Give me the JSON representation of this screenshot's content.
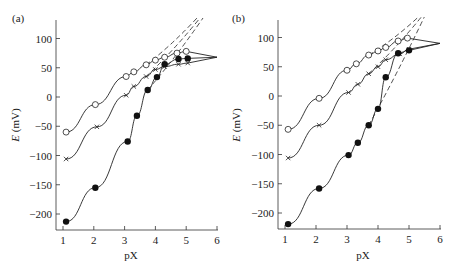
{
  "chart_data": [
    {
      "panel_label": "(a)",
      "type": "line",
      "title": "",
      "xlabel": "pX",
      "ylabel": "E (mV)",
      "xlim": [
        0.8,
        6
      ],
      "ylim": [
        -225,
        130
      ],
      "xticks": [
        1,
        2,
        3,
        4,
        5,
        6
      ],
      "yticks": [
        -200,
        -150,
        -100,
        -50,
        0,
        50,
        100
      ],
      "grid": false,
      "legend": "none",
      "series": [
        {
          "name": "open circles",
          "marker": "o",
          "x": [
            1.1,
            2.05,
            3.05,
            3.3,
            3.7,
            4.0,
            4.3,
            4.7,
            5.0
          ],
          "y": [
            -60,
            -13,
            35,
            43,
            55,
            63,
            68,
            75,
            78
          ]
        },
        {
          "name": "crosses",
          "marker": "x",
          "x": [
            1.1,
            2.1,
            3.05,
            3.3,
            3.7,
            4.0,
            4.3,
            4.75,
            5.05
          ],
          "y": [
            -106,
            -51,
            3,
            18,
            35,
            47,
            52,
            56,
            58
          ]
        },
        {
          "name": "filled circles",
          "marker": "filled",
          "x": [
            1.1,
            2.05,
            3.1,
            3.4,
            3.75,
            4.05,
            4.3,
            4.75,
            5.05
          ],
          "y": [
            -213,
            -155,
            -76,
            -32,
            12,
            34,
            56,
            65,
            66
          ]
        }
      ],
      "fitted_curves": "solid theoretical curves saturating at ~68 mV; dashed Nernstian lines rising beyond 130 mV"
    },
    {
      "panel_label": "(b)",
      "type": "line",
      "title": "",
      "xlabel": "pX",
      "ylabel": "E (mV)",
      "xlim": [
        0.8,
        6
      ],
      "ylim": [
        -225,
        130
      ],
      "xticks": [
        1,
        2,
        3,
        4,
        5,
        6
      ],
      "yticks": [
        -200,
        -150,
        -100,
        -50,
        0,
        50,
        100
      ],
      "grid": false,
      "legend": "none",
      "series": [
        {
          "name": "open circles",
          "marker": "o",
          "x": [
            1.1,
            2.1,
            3.0,
            3.3,
            3.7,
            4.0,
            4.25,
            4.65,
            4.95
          ],
          "y": [
            -57,
            -4,
            44,
            55,
            70,
            77,
            83,
            94,
            99
          ]
        },
        {
          "name": "crosses",
          "marker": "x",
          "x": [
            1.1,
            2.1,
            3.05,
            3.35,
            3.7,
            4.0,
            4.25,
            4.7,
            5.0
          ],
          "y": [
            -106,
            -50,
            6,
            20,
            38,
            50,
            62,
            72,
            80
          ]
        },
        {
          "name": "filled circles",
          "marker": "filled",
          "x": [
            1.1,
            2.1,
            3.05,
            3.35,
            3.7,
            4.0,
            4.25,
            4.65,
            5.0
          ],
          "y": [
            -219,
            -158,
            -101,
            -80,
            -50,
            -22,
            32,
            73,
            78
          ]
        }
      ],
      "fitted_curves": "solid theoretical curves saturating at ~90 mV; dashed Nernstian lines rising beyond 130 mV"
    }
  ],
  "labels": {
    "panel_a": "(a)",
    "panel_b": "(b)",
    "xlabel": "pX",
    "ylabel_italic": "E",
    "ylabel_unit": " (mV)"
  },
  "ticks": {
    "x": [
      "1",
      "2",
      "3",
      "4",
      "5",
      "6"
    ],
    "y": [
      "100",
      "50",
      "0",
      "−50",
      "−100",
      "−150",
      "−200"
    ]
  }
}
